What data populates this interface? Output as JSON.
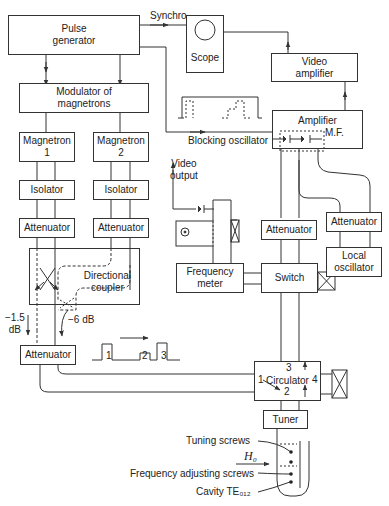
{
  "diagram": {
    "type": "block-diagram"
  },
  "blocks": {
    "pulse_generator": "Pulse\ngenerator",
    "modulator": "Modulator of\nmagnetrons",
    "magnetron_1": "Magnetron\n1",
    "magnetron_2": "Magnetron\n2",
    "isolator_1": "Isolator",
    "isolator_2": "Isolator",
    "attenuator_1": "Attenuator",
    "attenuator_2": "Attenuator",
    "directional_coupler": "Directional\ncoupler",
    "attenuator_combined": "Attenuator",
    "scope": "Scope",
    "video_amplifier": "Video\namplifier",
    "amplifier": "Amplifier",
    "amplifier_mf": "M.F.",
    "attenuator_lo": "Attenuator",
    "local_oscillator": "Local\noscillator",
    "attenuator_switch": "Attenuator",
    "frequency_meter": "Frequency\nmeter",
    "switch": "Switch",
    "circulator": "Circulator",
    "tuner": "Tuner"
  },
  "labels": {
    "synchro": "Synchro",
    "blocking_oscillator": "Blocking oscillator",
    "video_output": "Video\noutput",
    "loss_1": "−1.5\ndB",
    "loss_2": "−6 dB",
    "pulse_1": "1",
    "pulse_2": "2",
    "pulse_3": "3",
    "circ_port_1": "1",
    "circ_port_2": "2",
    "circ_port_3": "3",
    "circ_port_4": "4",
    "tuning_screws": "Tuning screws",
    "h0": "H₀",
    "freq_adjusting_screws": "Frequency adjusting screws",
    "cavity": "Cavity TE₀₁₂"
  },
  "colors": {
    "line": "#333333",
    "background": "#ffffff",
    "text": "#222222"
  }
}
